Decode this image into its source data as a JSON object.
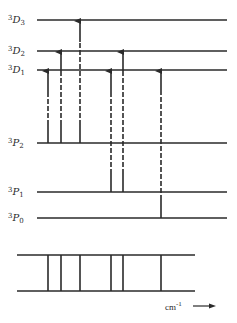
{
  "colors": {
    "ink": "#2a2a2a",
    "background": "#ffffff"
  },
  "levels": [
    {
      "id": "3D3",
      "sup": "3",
      "letter": "D",
      "sub": "3",
      "y": 20
    },
    {
      "id": "3D2",
      "sup": "3",
      "letter": "D",
      "sub": "2",
      "y": 51
    },
    {
      "id": "3D1",
      "sup": "3",
      "letter": "D",
      "sub": "1",
      "y": 70
    },
    {
      "id": "3P2",
      "sup": "3",
      "letter": "P",
      "sub": "2",
      "y": 143
    },
    {
      "id": "3P1",
      "sup": "3",
      "letter": "P",
      "sub": "1",
      "y": 192
    },
    {
      "id": "3P0",
      "sup": "3",
      "letter": "P",
      "sub": "0",
      "y": 218
    }
  ],
  "level_line": {
    "x1": 37,
    "x2": 227
  },
  "transitions": [
    {
      "x": 48,
      "from": "3P2",
      "to": "3D1"
    },
    {
      "x": 61,
      "from": "3P2",
      "to": "3D2"
    },
    {
      "x": 80,
      "from": "3P2",
      "to": "3D3"
    },
    {
      "x": 111,
      "from": "3P1",
      "to": "3D1"
    },
    {
      "x": 123,
      "from": "3P1",
      "to": "3D2"
    },
    {
      "x": 161,
      "from": "3P0",
      "to": "3D1"
    }
  ],
  "spectrum": {
    "x1": 17,
    "x2": 195,
    "y_top": 255,
    "y_bottom": 291
  },
  "axis_unit": {
    "label": "cm",
    "exponent": "-1"
  }
}
